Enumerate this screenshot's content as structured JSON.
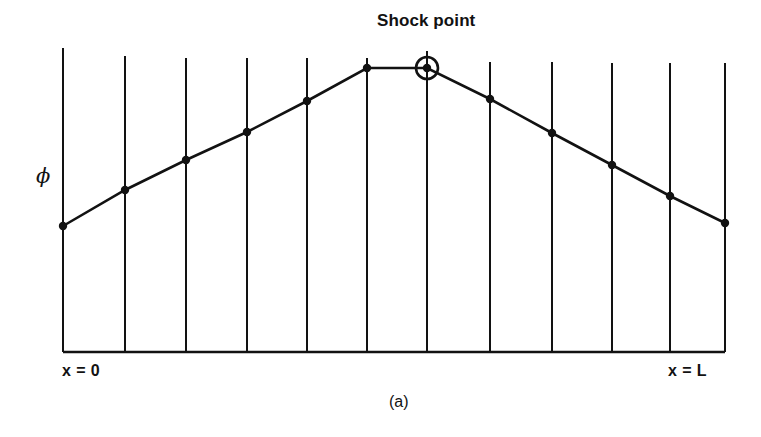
{
  "figure": {
    "subfigure_caption": "(a)",
    "annotation_label": "Shock point",
    "y_axis_label": "ϕ",
    "x_start_label": "x = 0",
    "x_end_label": "x = L",
    "line_color": "#121212",
    "background_color": "#ffffff"
  },
  "chart_data": {
    "type": "line",
    "title": "",
    "subtitle": "(a)",
    "xlabel": "",
    "ylabel": "ϕ",
    "grid": true,
    "legend_position": "none",
    "axis_style": "left-open; bottom axis and 12 vertical grid lines only",
    "x_tick_labels": [
      "x = 0",
      "x = L"
    ],
    "x_tick_positions": [
      0,
      11
    ],
    "xlim": [
      0,
      11
    ],
    "ylim": [
      0,
      11
    ],
    "x": [
      0,
      1,
      2,
      3,
      4,
      5,
      6,
      7,
      8,
      9,
      10,
      11
    ],
    "values": [
      4.4,
      5.7,
      6.8,
      7.8,
      8.9,
      10.1,
      10.1,
      9.0,
      7.8,
      6.7,
      5.6,
      4.5
    ],
    "series": [
      {
        "name": "potential ϕ",
        "values": [
          4.4,
          5.7,
          6.8,
          7.8,
          8.9,
          10.1,
          10.1,
          9.0,
          7.8,
          6.7,
          5.6,
          4.5
        ]
      }
    ],
    "markers": "filled-circle",
    "annotations": [
      {
        "text": "Shock point",
        "x_index": 6,
        "y": 10.1,
        "marker": "circled-node",
        "leader_line": true
      }
    ],
    "pixel_geometry": {
      "grid_x": [
        63,
        125,
        186,
        247,
        307,
        367,
        427,
        490,
        552,
        612,
        670,
        725
      ],
      "grid_top_y": [
        48,
        56,
        58,
        58,
        58,
        58,
        51,
        62,
        62,
        63,
        63,
        63
      ],
      "baseline_y": 352,
      "point_y": [
        226,
        190,
        160,
        132,
        101,
        68,
        68,
        99,
        133,
        165,
        196,
        223
      ],
      "shock_ring": {
        "cx": 427,
        "cy": 68,
        "r_outer": 11,
        "r_inner": 4.2
      },
      "node_radius": 4.2
    }
  }
}
